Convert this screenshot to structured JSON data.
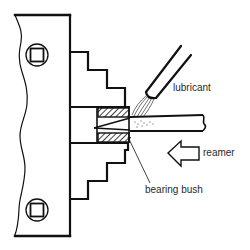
{
  "figure": {
    "colors": {
      "line": "#111111",
      "text": "#2a2a2a",
      "background": "#ffffff"
    }
  },
  "labels": {
    "lubricant": "lubricant",
    "reamer": "reamer",
    "bearing_bush": "bearing bush"
  },
  "parts": [
    {
      "id": "chuck",
      "name": "lathe chuck"
    },
    {
      "id": "chuck-key-socket-top",
      "name": "square key socket"
    },
    {
      "id": "chuck-key-socket-bottom",
      "name": "square key socket"
    },
    {
      "id": "jaw-upper",
      "name": "stepped jaw (upper)"
    },
    {
      "id": "jaw-lower",
      "name": "stepped jaw (lower)"
    },
    {
      "id": "bearing-bush",
      "name": "bearing bush"
    },
    {
      "id": "reamer",
      "name": "reamer"
    },
    {
      "id": "lubricant-nozzle",
      "name": "lubricant nozzle"
    },
    {
      "id": "reamer-direction-arrow",
      "name": "feed direction arrow"
    }
  ]
}
